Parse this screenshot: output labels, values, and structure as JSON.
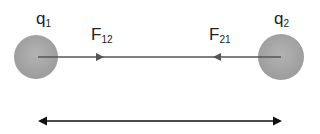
{
  "charges": [
    {
      "label": "q",
      "sub": "1",
      "cx": 36,
      "cy": 57,
      "r": 22
    },
    {
      "label": "q",
      "sub": "2",
      "cx": 281,
      "cy": 57,
      "r": 23
    }
  ],
  "forces": [
    {
      "label": "F",
      "sub": "12",
      "direction": "right"
    },
    {
      "label": "F",
      "sub": "21",
      "direction": "left"
    }
  ],
  "distance_arrow": {
    "direction": "both",
    "y": 121
  },
  "colors": {
    "sphere": "#a6a6a6",
    "line": "#555555",
    "arrow": "#111111"
  }
}
